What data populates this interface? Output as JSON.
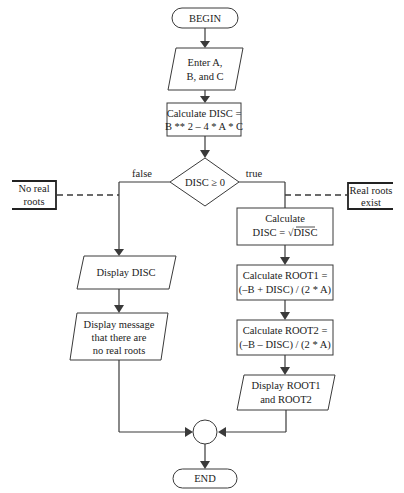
{
  "flowchart": {
    "begin": "BEGIN",
    "input": [
      "Enter A,",
      "B, and C"
    ],
    "calc_disc": [
      "Calculate DISC =",
      "B ** 2 – 4 * A * C"
    ],
    "decision": "DISC ≥ 0",
    "branch_false": "false",
    "branch_true": "true",
    "note_left": [
      "No real",
      "roots"
    ],
    "note_right": [
      "Real roots",
      "exist"
    ],
    "calc_sqrt": [
      "Calculate",
      "DISC = √DISC"
    ],
    "calc_root1": [
      "Calculate ROOT1 =",
      "(–B + DISC) / (2 * A)"
    ],
    "calc_root2": [
      "Calculate ROOT2 =",
      "(–B – DISC) / (2 * A)"
    ],
    "display_roots": [
      "Display ROOT1",
      "and ROOT2"
    ],
    "display_disc": "Display DISC",
    "display_message": [
      "Display message",
      "that there are",
      "no real roots"
    ],
    "end": "END"
  },
  "colors": {
    "stroke": "#3a3a3a",
    "text": "#222222",
    "background": "#ffffff"
  }
}
